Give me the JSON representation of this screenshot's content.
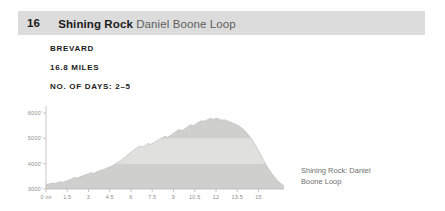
{
  "header": {
    "number": "16",
    "name": "Shining Rock",
    "subtitle": "Daniel Boone Loop"
  },
  "meta": {
    "location": "BREVARD",
    "distance": "16.8 MILES",
    "days": "NO. OF DAYS: 2–5"
  },
  "caption": {
    "line1": "Shining Rock: Daniel",
    "line2": "Boone Loop"
  },
  "colors": {
    "header_bg": "#dcdcdc",
    "text_dark": "#1b1b1b",
    "text_muted": "#5e5e5e",
    "caption": "#70706f",
    "axis": "#b8b8b8",
    "band_light": "#e0e0df",
    "band_dark": "#cfcfce"
  },
  "chart_data": {
    "type": "area",
    "title": "",
    "xlabel": "",
    "ylabel": "",
    "xlim": [
      0,
      16.8
    ],
    "ylim": [
      3000,
      6200
    ],
    "grid": true,
    "legend": false,
    "ytick_labels": [
      "6000'",
      "5000'",
      "4000'",
      "3000'"
    ],
    "ytick_values": [
      6000,
      5000,
      4000,
      3000
    ],
    "xtick_labels": [
      "0 mi",
      "1.5",
      "3",
      "4.5",
      "6",
      "7.5",
      "9",
      "10.5",
      "12",
      "13.5",
      "15"
    ],
    "xtick_values": [
      0,
      1.5,
      3,
      4.5,
      6,
      7.5,
      9,
      10.5,
      12,
      13.5,
      15
    ],
    "band_boundaries": [
      3000,
      4000,
      5000,
      6000
    ],
    "x": [
      0,
      0.2,
      0.4,
      0.6,
      0.8,
      1.0,
      1.2,
      1.4,
      1.6,
      1.8,
      2.0,
      2.2,
      2.4,
      2.6,
      2.8,
      3.0,
      3.2,
      3.4,
      3.6,
      3.8,
      4.0,
      4.2,
      4.4,
      4.6,
      4.8,
      5.0,
      5.2,
      5.4,
      5.6,
      5.8,
      6.0,
      6.2,
      6.4,
      6.6,
      6.8,
      7.0,
      7.2,
      7.4,
      7.6,
      7.8,
      8.0,
      8.2,
      8.4,
      8.6,
      8.8,
      9.0,
      9.2,
      9.4,
      9.6,
      9.8,
      10.0,
      10.2,
      10.4,
      10.6,
      10.8,
      11.0,
      11.2,
      11.4,
      11.6,
      11.8,
      12.0,
      12.2,
      12.4,
      12.6,
      12.8,
      13.0,
      13.2,
      13.4,
      13.6,
      13.8,
      14.0,
      14.2,
      14.4,
      14.6,
      14.8,
      15.0,
      15.3,
      15.6,
      16.0,
      16.4,
      16.8
    ],
    "y": [
      3180,
      3200,
      3230,
      3215,
      3250,
      3290,
      3270,
      3310,
      3360,
      3400,
      3450,
      3430,
      3480,
      3520,
      3570,
      3600,
      3640,
      3620,
      3680,
      3730,
      3760,
      3800,
      3850,
      3900,
      3960,
      4030,
      4100,
      4180,
      4270,
      4360,
      4450,
      4530,
      4620,
      4700,
      4660,
      4720,
      4800,
      4760,
      4830,
      4900,
      4960,
      5020,
      5080,
      5040,
      5120,
      5200,
      5280,
      5350,
      5300,
      5380,
      5460,
      5540,
      5500,
      5580,
      5650,
      5700,
      5680,
      5740,
      5790,
      5750,
      5800,
      5770,
      5720,
      5740,
      5690,
      5650,
      5600,
      5560,
      5500,
      5420,
      5320,
      5200,
      5060,
      4900,
      4720,
      4520,
      4200,
      3900,
      3560,
      3300,
      3120
    ]
  }
}
